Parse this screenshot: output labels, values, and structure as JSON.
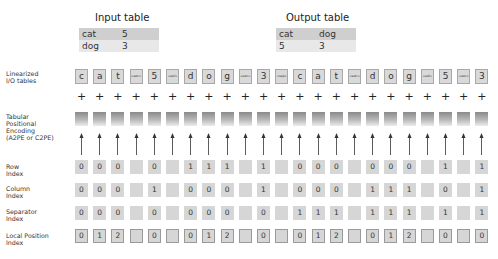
{
  "input_table": {
    "title": "Input table",
    "rows": [
      [
        "cat",
        "5"
      ],
      [
        "dog",
        "3"
      ]
    ]
  },
  "output_table": {
    "title": "Output table",
    "rows": [
      [
        "cat",
        "dog"
      ],
      [
        "5",
        "3"
      ]
    ]
  },
  "row_labels": {
    "tokens": "Linearized\nI/O tables",
    "encoding": "Tabular\nPositional\nEncoding\n(A2PE or C2PE)",
    "row_index": "Row\nIndex",
    "column_index": "Column\nIndex",
    "separator_index": "Separator\nIndex",
    "local_position_index": "Local Position\nIndex"
  },
  "tokens": [
    "c",
    "a",
    "t",
    "<eoc>",
    "5",
    "<eol>",
    "d",
    "o",
    "g",
    "<eoc>",
    "3",
    "<sep>",
    "c",
    "a",
    "t",
    "<eoc>",
    "d",
    "o",
    "g",
    "<eol>",
    "5",
    "<eoc>",
    "3"
  ],
  "plus_symbol": "+",
  "row_index": [
    "0",
    "0",
    "0",
    "",
    "0",
    "",
    "1",
    "1",
    "1",
    "",
    "1",
    "",
    "0",
    "0",
    "0",
    "",
    "0",
    "0",
    "0",
    "",
    "1",
    "",
    "1"
  ],
  "column_index": [
    "0",
    "0",
    "0",
    "",
    "1",
    "",
    "0",
    "0",
    "0",
    "",
    "1",
    "",
    "0",
    "0",
    "0",
    "",
    "1",
    "1",
    "1",
    "",
    "0",
    "",
    "1"
  ],
  "separator_index": [
    "0",
    "0",
    "0",
    "",
    "0",
    "",
    "0",
    "0",
    "0",
    "",
    "0",
    "",
    "1",
    "1",
    "1",
    "",
    "1",
    "1",
    "1",
    "",
    "1",
    "",
    "1"
  ],
  "local_position_index": [
    "0",
    "1",
    "2",
    "",
    "0",
    "",
    "0",
    "1",
    "2",
    "",
    "0",
    "",
    "0",
    "1",
    "2",
    "",
    "0",
    "1",
    "2",
    "",
    "0",
    "",
    "0"
  ],
  "colors": {
    "token_fill": "#d9d9d9",
    "token_border": "#a8a8a8",
    "table_header_fill": "#cfcfcf",
    "table_row_fill": "#e8e8e8",
    "encoding_gradient_top": "#8a8a8a",
    "encoding_gradient_bottom": "#ececec"
  }
}
